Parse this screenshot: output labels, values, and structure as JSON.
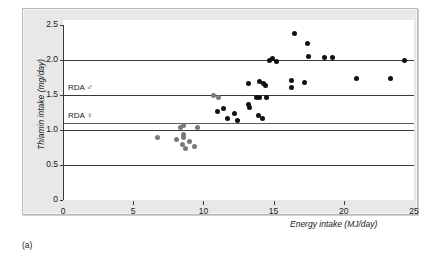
{
  "figure": {
    "caption": "(a)",
    "panel_background": "#e8e8e8",
    "plot_background": "#ffffff",
    "point_color": "#111111",
    "gridline_color": "#3a3a3a"
  },
  "chart_data": {
    "type": "scatter",
    "title": "",
    "xlabel": "Energy intake (MJ/day)",
    "ylabel": "Thiamin intake (mg/day)",
    "xlim": [
      0,
      25
    ],
    "ylim": [
      0,
      2.5
    ],
    "xticks": [
      0,
      5,
      10,
      15,
      20,
      25
    ],
    "xticklabels": [
      "0",
      "5",
      "10",
      "15",
      "20",
      "25"
    ],
    "yticks": [
      0,
      0.5,
      1.0,
      1.5,
      2.0,
      2.5
    ],
    "yticklabels": [
      "0",
      "0.5",
      "1.0",
      "1.5",
      "2.0",
      "2.5"
    ],
    "grid": true,
    "legend": "none",
    "reference_lines": [
      {
        "label": "RDA ♂",
        "value": 1.5,
        "name": "rda-male"
      },
      {
        "label": "RDA ♀",
        "value": 1.1,
        "name": "rda-female"
      }
    ],
    "gridline_values": [
      0.5,
      1.0,
      1.1,
      1.5,
      2.0
    ],
    "points": [
      {
        "x": 6.7,
        "y": 0.9,
        "shade": "gray"
      },
      {
        "x": 8.1,
        "y": 0.86,
        "shade": "gray"
      },
      {
        "x": 8.5,
        "y": 0.79,
        "shade": "gray"
      },
      {
        "x": 9.0,
        "y": 0.83,
        "shade": "gray"
      },
      {
        "x": 8.7,
        "y": 0.74,
        "shade": "gray"
      },
      {
        "x": 9.4,
        "y": 0.76,
        "shade": "gray"
      },
      {
        "x": 8.6,
        "y": 0.89,
        "shade": "gray"
      },
      {
        "x": 8.6,
        "y": 0.93,
        "shade": "gray"
      },
      {
        "x": 8.4,
        "y": 1.04,
        "shade": "gray"
      },
      {
        "x": 8.6,
        "y": 1.06,
        "shade": "gray"
      },
      {
        "x": 9.6,
        "y": 1.03,
        "shade": "gray"
      },
      {
        "x": 10.7,
        "y": 1.49,
        "shade": "gray"
      },
      {
        "x": 11.1,
        "y": 1.46,
        "shade": "gray"
      },
      {
        "x": 11.0,
        "y": 1.26,
        "shade": "black"
      },
      {
        "x": 11.4,
        "y": 1.31,
        "shade": "black"
      },
      {
        "x": 12.2,
        "y": 1.23,
        "shade": "black"
      },
      {
        "x": 11.7,
        "y": 1.17,
        "shade": "black"
      },
      {
        "x": 13.3,
        "y": 1.32,
        "shade": "black"
      },
      {
        "x": 13.2,
        "y": 1.36,
        "shade": "black"
      },
      {
        "x": 12.4,
        "y": 1.14,
        "shade": "black"
      },
      {
        "x": 13.9,
        "y": 1.21,
        "shade": "black"
      },
      {
        "x": 14.2,
        "y": 1.17,
        "shade": "black"
      },
      {
        "x": 13.8,
        "y": 1.46,
        "shade": "black"
      },
      {
        "x": 14.0,
        "y": 1.47,
        "shade": "black"
      },
      {
        "x": 14.5,
        "y": 1.46,
        "shade": "black"
      },
      {
        "x": 13.2,
        "y": 1.67,
        "shade": "black"
      },
      {
        "x": 14.0,
        "y": 1.7,
        "shade": "black"
      },
      {
        "x": 14.3,
        "y": 1.66,
        "shade": "black"
      },
      {
        "x": 14.4,
        "y": 1.63,
        "shade": "black"
      },
      {
        "x": 14.7,
        "y": 1.99,
        "shade": "black"
      },
      {
        "x": 14.9,
        "y": 2.02,
        "shade": "black"
      },
      {
        "x": 15.2,
        "y": 1.98,
        "shade": "black"
      },
      {
        "x": 16.5,
        "y": 2.38,
        "shade": "black"
      },
      {
        "x": 17.4,
        "y": 2.24,
        "shade": "black"
      },
      {
        "x": 16.3,
        "y": 1.71,
        "shade": "black"
      },
      {
        "x": 16.3,
        "y": 1.61,
        "shade": "black"
      },
      {
        "x": 17.2,
        "y": 1.68,
        "shade": "black"
      },
      {
        "x": 17.5,
        "y": 2.05,
        "shade": "black"
      },
      {
        "x": 18.6,
        "y": 2.04,
        "shade": "black"
      },
      {
        "x": 19.2,
        "y": 2.04,
        "shade": "black"
      },
      {
        "x": 20.9,
        "y": 1.73,
        "shade": "black"
      },
      {
        "x": 24.3,
        "y": 1.99,
        "shade": "black"
      },
      {
        "x": 23.3,
        "y": 1.73,
        "shade": "black"
      }
    ]
  }
}
